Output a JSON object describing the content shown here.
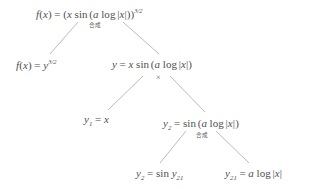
{
  "diagram": {
    "background_color": "#ffffff",
    "text_color": "#4f4f4f",
    "line_color": "#a9a9a9",
    "nodes": [
      {
        "id": "root",
        "name": "node-root",
        "text": "f(x) = (x sin(a log|x|))^(3/2)",
        "x": 36,
        "y": 8
      },
      {
        "id": "l1-left",
        "name": "node-outer-power",
        "text": "f(x) = y^(3/2)",
        "x": 16,
        "y": 59
      },
      {
        "id": "l1-right",
        "name": "node-product",
        "text": "y = x sin(a log|x|)",
        "x": 112,
        "y": 59
      },
      {
        "id": "l2-left",
        "name": "node-y1",
        "text": "y_1 = x",
        "x": 84,
        "y": 114
      },
      {
        "id": "l2-right",
        "name": "node-y2",
        "text": "y_2 = sin(a log|x|)",
        "x": 163,
        "y": 118
      },
      {
        "id": "l3-left",
        "name": "node-y2-sin",
        "text": "y_2 = sin y_21",
        "x": 136,
        "y": 168
      },
      {
        "id": "l3-right",
        "name": "node-y21-log",
        "text": "y_21 = a log|x|",
        "x": 225,
        "y": 168
      }
    ],
    "edge_labels": [
      {
        "id": "comp-top",
        "name": "edge-label-composition-top",
        "text": "合成",
        "x": 89,
        "y": 23
      },
      {
        "id": "times-mid",
        "name": "edge-label-product",
        "text": "×",
        "x": 156,
        "y": 74
      },
      {
        "id": "comp-bottom",
        "name": "edge-label-composition-bottom",
        "text": "合成",
        "x": 196,
        "y": 133
      }
    ],
    "edges": [
      {
        "name": "edge-root-to-outer-power",
        "x1": 78,
        "y1": 22,
        "x2": 50,
        "y2": 54
      },
      {
        "name": "edge-root-to-product",
        "x1": 123,
        "y1": 22,
        "x2": 159,
        "y2": 54
      },
      {
        "name": "edge-product-to-y1",
        "x1": 143,
        "y1": 76,
        "x2": 108,
        "y2": 110
      },
      {
        "name": "edge-product-to-y2",
        "x1": 170,
        "y1": 76,
        "x2": 205,
        "y2": 112
      },
      {
        "name": "edge-y2-to-sin",
        "x1": 186,
        "y1": 131,
        "x2": 160,
        "y2": 163
      },
      {
        "name": "edge-y2-to-log",
        "x1": 216,
        "y1": 131,
        "x2": 249,
        "y2": 163
      }
    ]
  }
}
